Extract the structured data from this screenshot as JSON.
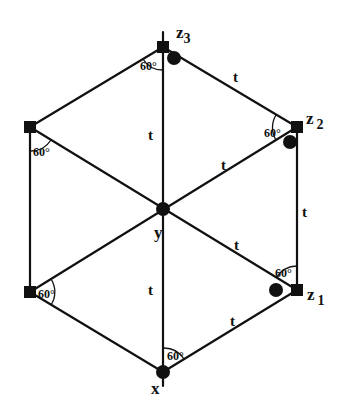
{
  "diagram": {
    "type": "hexagon-graph",
    "stroke_color": "#111111",
    "background": "#ffffff",
    "vertices": {
      "top": {
        "x": 163,
        "y": 47,
        "label": "z",
        "sub": "3",
        "marker": "square"
      },
      "upper_right": {
        "x": 297,
        "y": 127,
        "label": "z",
        "sub": "2",
        "marker": "square"
      },
      "lower_right": {
        "x": 297,
        "y": 290,
        "label": "z",
        "sub": "1",
        "marker": "square"
      },
      "bottom": {
        "x": 163,
        "y": 372,
        "label": "x",
        "sub": "",
        "marker": "dot"
      },
      "lower_left": {
        "x": 30,
        "y": 292,
        "label": "",
        "sub": "",
        "marker": "square"
      },
      "upper_left": {
        "x": 30,
        "y": 127,
        "label": "",
        "sub": "",
        "marker": "square"
      },
      "center": {
        "x": 163,
        "y": 209,
        "label": "y",
        "sub": "",
        "marker": "dot"
      }
    },
    "edge_labels": [
      {
        "text": "t",
        "x": 236,
        "y": 77
      },
      {
        "text": "t",
        "x": 149,
        "y": 135
      },
      {
        "text": "t",
        "x": 224,
        "y": 166
      },
      {
        "text": "t",
        "x": 305,
        "y": 213
      },
      {
        "text": "t",
        "x": 237,
        "y": 246
      },
      {
        "text": "t",
        "x": 149,
        "y": 291
      },
      {
        "text": "t",
        "x": 233,
        "y": 322
      }
    ],
    "angle_labels": [
      {
        "text": "60°",
        "x": 138,
        "y": 68
      },
      {
        "text": "60°",
        "x": 261,
        "y": 136
      },
      {
        "text": "60°",
        "x": 275,
        "y": 274
      },
      {
        "text": "60°",
        "x": 168,
        "y": 357
      },
      {
        "text": "60°",
        "x": 34,
        "y": 296
      },
      {
        "text": "60°",
        "x": 32,
        "y": 154
      }
    ],
    "vertex_labels": {
      "z3": {
        "main": "z",
        "sub": "3"
      },
      "z2": {
        "main": "z",
        "sub": "2"
      },
      "z1": {
        "main": "z",
        "sub": "1"
      },
      "x": {
        "main": "x"
      },
      "y": {
        "main": "y"
      }
    }
  }
}
